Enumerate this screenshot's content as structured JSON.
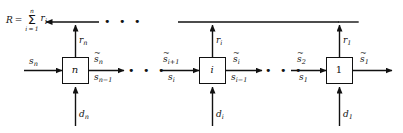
{
  "figure": {
    "background_color": "#ffffff",
    "line_color": "#111111",
    "text_color": "#111111"
  },
  "reward_sum": {
    "lhs": "R",
    "equals": "=",
    "sigma_upper": "n",
    "sigma_symbol": "Σ",
    "sigma_lower": "i = 1",
    "summand_base": "r",
    "summand_sub": "i"
  },
  "blocks": [
    {
      "name": "block-n",
      "label": "n"
    },
    {
      "name": "block-i",
      "label": "i"
    },
    {
      "name": "block-1",
      "label": "1"
    }
  ],
  "signals": {
    "stage_n": {
      "input_left_top": {
        "base": "s",
        "sub": "n",
        "tilde": false
      },
      "output_right_top": {
        "base": "s",
        "sub": "n",
        "tilde": true
      },
      "output_right_bottom": {
        "base": "s",
        "sub": "n−1",
        "tilde": false
      },
      "disturbance_bottom": {
        "base": "d",
        "sub": "n",
        "tilde": false
      },
      "reward_top": {
        "base": "r",
        "sub": "n",
        "tilde": false
      }
    },
    "stage_i": {
      "input_left_top": {
        "base": "s",
        "sub": "i+1",
        "tilde": true
      },
      "input_left_bottom": {
        "base": "s",
        "sub": "i",
        "tilde": false
      },
      "output_right_top": {
        "base": "s",
        "sub": "i",
        "tilde": true
      },
      "output_right_bottom": {
        "base": "s",
        "sub": "i−1",
        "tilde": false
      },
      "disturbance_bottom": {
        "base": "d",
        "sub": "i",
        "tilde": false
      },
      "reward_top": {
        "base": "r",
        "sub": "i",
        "tilde": false
      }
    },
    "stage_1": {
      "input_left_top": {
        "base": "s",
        "sub": "2",
        "tilde": true
      },
      "input_left_bottom": {
        "base": "s",
        "sub": "1",
        "tilde": false
      },
      "output_right_top": {
        "base": "s",
        "sub": "1",
        "tilde": true
      },
      "disturbance_bottom": {
        "base": "d",
        "sub": "1",
        "tilde": false
      },
      "reward_top": {
        "base": "r",
        "sub": "1",
        "tilde": false
      }
    }
  },
  "ellipses": {
    "top_rail": "• • •",
    "chain_left": "• • •",
    "chain_right": "• • •"
  }
}
